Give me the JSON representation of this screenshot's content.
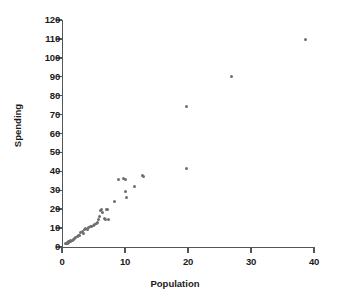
{
  "chart_data": {
    "type": "scatter",
    "title": "",
    "xlabel": "Population",
    "ylabel": "Spending",
    "xlim": [
      0,
      40
    ],
    "ylim": [
      0,
      120
    ],
    "xticks": [
      0,
      10,
      20,
      30,
      40
    ],
    "yticks": [
      0,
      10,
      20,
      30,
      40,
      50,
      60,
      70,
      80,
      90,
      100,
      110,
      120
    ],
    "grid": false,
    "legend": null,
    "marker_color": "#6e6e6e",
    "axis_color": "#555555",
    "points": [
      [
        0.6,
        1.8
      ],
      [
        0.7,
        2.0
      ],
      [
        0.8,
        2.2
      ],
      [
        0.9,
        2.0
      ],
      [
        1.0,
        2.6
      ],
      [
        1.0,
        3.0
      ],
      [
        1.1,
        2.4
      ],
      [
        1.2,
        3.1
      ],
      [
        1.3,
        2.8
      ],
      [
        1.4,
        3.4
      ],
      [
        1.6,
        3.2
      ],
      [
        1.8,
        4.0
      ],
      [
        2.0,
        4.6
      ],
      [
        2.2,
        5.0
      ],
      [
        2.4,
        5.6
      ],
      [
        2.6,
        6.0
      ],
      [
        2.8,
        6.2
      ],
      [
        3.0,
        7.6
      ],
      [
        3.2,
        8.0
      ],
      [
        3.4,
        7.2
      ],
      [
        3.6,
        9.0
      ],
      [
        3.8,
        9.6
      ],
      [
        4.0,
        9.2
      ],
      [
        4.2,
        10.4
      ],
      [
        4.5,
        11.0
      ],
      [
        4.7,
        10.6
      ],
      [
        5.0,
        11.6
      ],
      [
        5.2,
        12.0
      ],
      [
        5.4,
        12.6
      ],
      [
        5.6,
        13.0
      ],
      [
        5.8,
        14.6
      ],
      [
        6.0,
        16.2
      ],
      [
        6.1,
        19.4
      ],
      [
        6.3,
        19.8
      ],
      [
        6.5,
        18.0
      ],
      [
        6.7,
        15.2
      ],
      [
        6.9,
        14.4
      ],
      [
        7.0,
        20.0
      ],
      [
        7.2,
        19.6
      ],
      [
        7.4,
        14.6
      ],
      [
        8.4,
        23.8
      ],
      [
        8.9,
        35.6
      ],
      [
        9.8,
        36.0
      ],
      [
        10.0,
        35.8
      ],
      [
        10.1,
        29.4
      ],
      [
        10.2,
        26.2
      ],
      [
        11.5,
        32.0
      ],
      [
        12.8,
        37.6
      ],
      [
        13.0,
        37.4
      ],
      [
        19.8,
        74.2
      ],
      [
        19.8,
        41.6
      ],
      [
        26.9,
        90.0
      ],
      [
        38.7,
        109.6
      ]
    ]
  },
  "axis": {
    "x_title": "Population",
    "y_title": "Spending",
    "x_tick_labels": [
      "0",
      "10",
      "20",
      "30",
      "40"
    ],
    "y_tick_labels": [
      "0",
      "10",
      "20",
      "30",
      "40",
      "50",
      "60",
      "70",
      "80",
      "90",
      "100",
      "110",
      "120"
    ]
  }
}
